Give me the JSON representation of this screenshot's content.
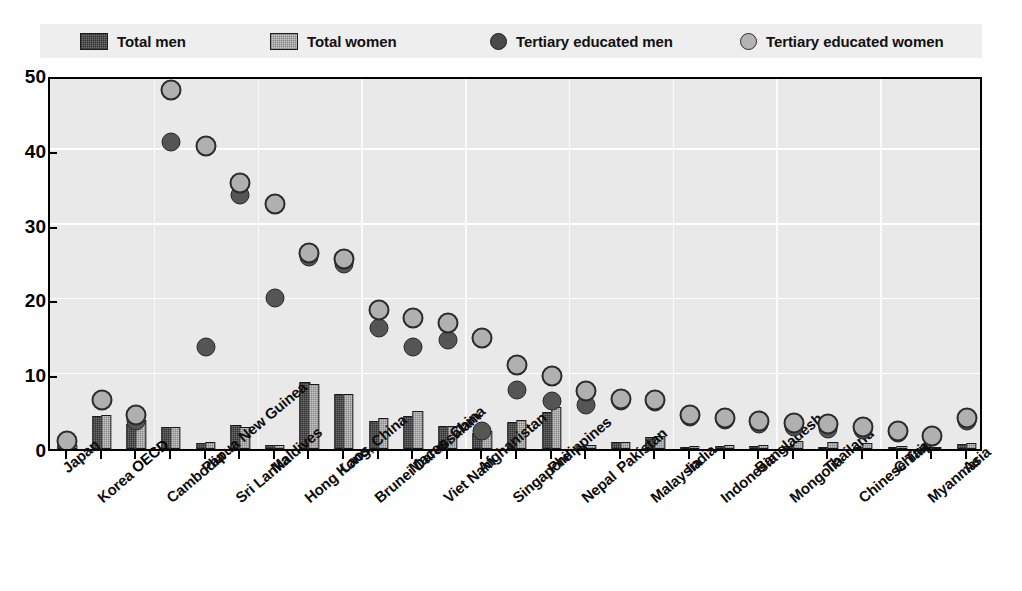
{
  "legend": {
    "items": [
      {
        "id": "total-men",
        "label": "Total men",
        "marker": "bar-dark-hatched",
        "color": "#6e6e6e"
      },
      {
        "id": "total-women",
        "label": "Total women",
        "marker": "bar-light-hatched",
        "color": "#c6c6c6"
      },
      {
        "id": "tertiary-men",
        "label": "Tertiary educated men",
        "marker": "circle-dark",
        "color": "#555555"
      },
      {
        "id": "tertiary-women",
        "label": "Tertiary educated women",
        "marker": "circle-light",
        "color": "#b0b0b0"
      }
    ]
  },
  "axis": {
    "y_ticks": [
      "0",
      "10",
      "20",
      "30",
      "40",
      "50"
    ],
    "y_min": 0,
    "y_max": 50
  },
  "chart_data": {
    "type": "bar",
    "title": "",
    "subtitle": "",
    "xlabel": "",
    "ylabel": "",
    "ylim": [
      0,
      50
    ],
    "ytick_step": 10,
    "grid": "horizontal-and-vertical-white",
    "legend_position": "top",
    "bold_categories": [
      "OECD"
    ],
    "categories": [
      "Japan",
      "Korea",
      "OECD",
      "Cambodia",
      "Papua New Guinea",
      "Sri Lanka",
      "Maldives",
      "Hong Kong, China",
      "Laos",
      "Brunei Darussalam",
      "Macao, China",
      "Viet Nam",
      "Afghanistan",
      "Singapore",
      "Philippines",
      "Nepal",
      "Pakistan",
      "Malaysia",
      "India",
      "Indonesia",
      "Bangladesh",
      "Mongolia",
      "Thailand",
      "Chinese Taipei",
      "China",
      "Myanmar",
      "Asia"
    ],
    "series": [
      {
        "name": "Total men",
        "type": "bar",
        "values": [
          0.5,
          4.4,
          3.3,
          3.0,
          0.8,
          3.2,
          0.5,
          9.0,
          7.3,
          3.7,
          4.4,
          3.1,
          2.2,
          3.6,
          5.0,
          0.4,
          0.9,
          1.6,
          0.3,
          0.4,
          0.4,
          0.4,
          0.3,
          0.3,
          0.2,
          0.2,
          0.7
        ]
      },
      {
        "name": "Total women",
        "type": "bar",
        "values": [
          0.6,
          4.5,
          3.9,
          3.0,
          0.9,
          3.0,
          0.6,
          8.7,
          7.3,
          4.2,
          5.1,
          3.1,
          2.4,
          3.9,
          5.6,
          0.5,
          1.0,
          1.8,
          0.4,
          0.5,
          0.5,
          1.1,
          0.9,
          0.8,
          0.4,
          0.3,
          0.8
        ]
      },
      {
        "name": "Tertiary educated men",
        "type": "scatter",
        "values": [
          null,
          6.6,
          3.8,
          41.0,
          13.6,
          34.0,
          20.2,
          25.7,
          24.7,
          16.2,
          13.7,
          14.6,
          2.4,
          7.9,
          6.4,
          5.9,
          6.4,
          6.3,
          4.3,
          3.9,
          3.4,
          2.9,
          2.7,
          2.5,
          2.1,
          1.6,
          3.8
        ]
      },
      {
        "name": "Tertiary educated women",
        "type": "scatter",
        "values": [
          1.1,
          6.6,
          4.5,
          48.0,
          40.5,
          35.5,
          32.8,
          26.2,
          25.4,
          18.6,
          17.5,
          16.8,
          14.8,
          11.2,
          9.8,
          7.7,
          6.7,
          6.6,
          4.5,
          4.2,
          3.7,
          3.5,
          3.3,
          3.0,
          2.4,
          1.8,
          4.1
        ]
      }
    ]
  }
}
